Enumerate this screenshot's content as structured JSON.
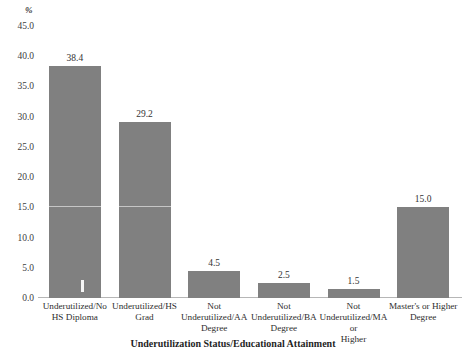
{
  "chart_data": {
    "type": "bar",
    "title": "",
    "subtitle": "",
    "xlabel": "Underutilization Status/Educational Attainment",
    "ylabel": "%",
    "categories": [
      "Underutilized/No HS Diploma",
      "Underutilized/HS Grad",
      "Not Underutilized/AA Degree",
      "Not Underutilized/BA Degree",
      "Not Underutilized/MA or Higher",
      "Master's or Higher Degree"
    ],
    "category_lines": [
      [
        "Underutilized/No",
        "HS Diploma"
      ],
      [
        "Underutilized/HS",
        "Grad"
      ],
      [
        "Not",
        "Underutilized/AA",
        "Degree"
      ],
      [
        "Not",
        "Underutilized/BA",
        "Degree"
      ],
      [
        "Not",
        "Underutilized/MA or",
        "Higher"
      ],
      [
        "Master's or Higher",
        "Degree"
      ]
    ],
    "values": [
      38.4,
      29.2,
      4.5,
      2.5,
      1.5,
      15.0
    ],
    "value_labels": [
      "38.4",
      "29.2",
      "4.5",
      "2.5",
      "1.5",
      "15.0"
    ],
    "ylim": [
      0.0,
      45.0
    ],
    "yticks": [
      0.0,
      5.0,
      10.0,
      15.0,
      20.0,
      25.0,
      30.0,
      35.0,
      40.0,
      45.0
    ],
    "ytick_labels": [
      "0.0",
      "5.0",
      "10.0",
      "15.0",
      "20.0",
      "25.0",
      "30.0",
      "35.0",
      "40.0",
      "45.0"
    ],
    "grid": false,
    "legend": "none",
    "bar_color": "#808080",
    "axis_color": "#b6b6b6",
    "text_color": "#2e2e2e"
  },
  "axis": {
    "y_unit": "%",
    "x_title": "Underutilization Status/Educational Attainment"
  }
}
